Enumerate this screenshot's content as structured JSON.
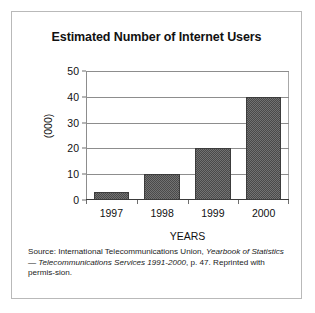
{
  "figure": {
    "title": "Estimated Number of Internet Users",
    "xlabel": "YEARS",
    "ylabel": "(000)",
    "source_line1_prefix": "Source: International Telecommunications Union, ",
    "source_line1_italic": "Yearbook of Statistics",
    "source_line2_dash": "— ",
    "source_line2_italic": "Telecommunications Services 1991-2000",
    "source_line2_rest": ", p. 47. Reprinted with permis-",
    "source_line3": "sion."
  },
  "chart_data": {
    "type": "bar",
    "title": "Estimated Number of Internet Users",
    "xlabel": "YEARS",
    "ylabel": "(000)",
    "categories": [
      "1997",
      "1998",
      "1999",
      "2000"
    ],
    "values": [
      3,
      10,
      20,
      40
    ],
    "ylim": [
      0,
      50
    ],
    "yticks": [
      0,
      10,
      20,
      30,
      40,
      50
    ],
    "ytick_labels": [
      "0",
      "10",
      "20",
      "30",
      "40",
      "50"
    ],
    "grid": "horizontal",
    "legend": "none",
    "bar_color": "#4a4a4a",
    "bar_fill_pattern": "dithered-checker",
    "background_color": "#ffffff",
    "axis_color": "#3a3a3a",
    "grid_color": "#8d8d8d"
  }
}
